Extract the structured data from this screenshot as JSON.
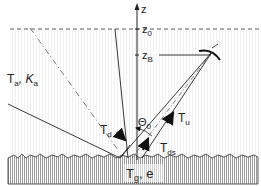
{
  "diagram": {
    "type": "radiometric-geometry",
    "axis": {
      "label": "z"
    },
    "levels": [
      {
        "id": "z0",
        "label": "z",
        "subscript": "0"
      },
      {
        "id": "zB",
        "label": "z",
        "subscript": "B"
      }
    ],
    "atmosphere": {
      "label": "T",
      "label_sub": "a",
      "label2": ", K",
      "label2_sub": "a"
    },
    "angle": {
      "label": "Θ",
      "subscript": "0"
    },
    "fluxes": [
      {
        "id": "Tu",
        "label": "T",
        "subscript": "u"
      },
      {
        "id": "Td",
        "label": "T",
        "subscript": "d"
      },
      {
        "id": "Tds",
        "label": "T",
        "subscript": "ds"
      }
    ],
    "ground": {
      "label": "T",
      "subscript": "g",
      "label2": ", e"
    }
  }
}
